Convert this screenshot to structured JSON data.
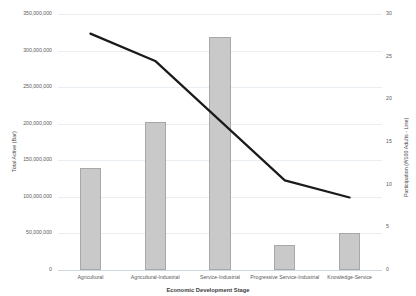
{
  "chart_data": {
    "type": "bar",
    "title": "",
    "xlabel": "Economic Development Stage",
    "categories": [
      "Agricultural",
      "Agricultural-Industrial",
      "Service-Industrial",
      "Progressive Service-Industrial",
      "Knowledge-Service"
    ],
    "grid": true,
    "legend_position": "none",
    "series": [
      {
        "name": "Total Active (Bar)",
        "type": "bar",
        "axis": "left",
        "values": [
          140000000,
          203000000,
          318000000,
          34000000,
          50000000
        ],
        "color": "#c9c9c9",
        "border_color": "#a8a8a8"
      },
      {
        "name": "Participation (#/100 Adults - Line)",
        "type": "line",
        "axis": "right",
        "values": [
          27.7,
          24.5,
          17.5,
          10.5,
          8.5
        ],
        "color": "#1a1a1a"
      }
    ],
    "axes": {
      "left": {
        "label": "Total Active (Bar)",
        "ylim": [
          0,
          350000000
        ],
        "tick_step": 50000000,
        "ticks": [
          0,
          50000000,
          100000000,
          150000000,
          200000000,
          250000000,
          300000000,
          350000000
        ],
        "tick_labels": [
          "0",
          "50,000,000",
          "100,000,000",
          "150,000,000",
          "200,000,000",
          "250,000,000",
          "300,000,000",
          "350,000,000"
        ]
      },
      "right": {
        "label": "Participation (#/100 Adults - Line)",
        "ylim": [
          0,
          30
        ],
        "tick_step": 5,
        "ticks": [
          0,
          5,
          10,
          15,
          20,
          25,
          30
        ],
        "tick_labels": [
          "0",
          "5",
          "10",
          "15",
          "20",
          "25",
          "30"
        ]
      }
    }
  },
  "colors": {
    "bar_fill": "#c9c9c9",
    "bar_stroke": "#a8a8a8",
    "line": "#1a1a1a",
    "gridline": "#e8eef2",
    "axis_text": "#5a5a5a",
    "background": "#ffffff"
  }
}
